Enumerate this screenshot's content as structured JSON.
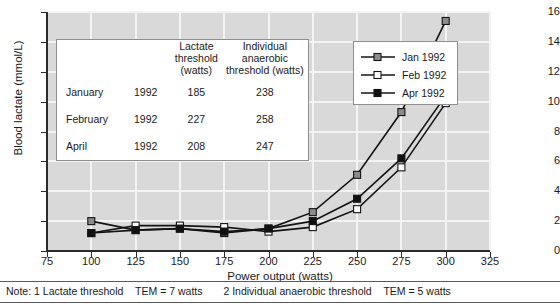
{
  "chart_data": {
    "type": "line",
    "title": "",
    "xlabel": "Power output (watts)",
    "ylabel": "Blood lactate (mmol/L)",
    "xlim": [
      75,
      325
    ],
    "ylim": [
      0,
      16
    ],
    "xticks": [
      75,
      100,
      125,
      150,
      175,
      200,
      225,
      250,
      275,
      300,
      325
    ],
    "yticks": [
      0,
      2,
      4,
      6,
      8,
      10,
      12,
      14,
      16
    ],
    "grid": true,
    "legend_position": "upper-right",
    "x": [
      100,
      125,
      150,
      175,
      200,
      225,
      250,
      275,
      300
    ],
    "series": [
      {
        "name": "Jan 1992",
        "marker": "filled-gray-square",
        "color": "#8c8c8c",
        "values": [
          2.0,
          1.4,
          1.5,
          1.2,
          1.5,
          2.6,
          5.1,
          9.3,
          15.4
        ]
      },
      {
        "name": "Feb 1992",
        "marker": "open-square",
        "color": "#ffffff",
        "values": [
          1.2,
          1.7,
          1.7,
          1.6,
          1.3,
          1.6,
          2.8,
          5.6,
          9.9
        ]
      },
      {
        "name": "Apr 1992",
        "marker": "filled-black-square",
        "color": "#111111",
        "values": [
          1.2,
          1.4,
          1.5,
          1.3,
          1.5,
          2.0,
          3.5,
          6.2,
          10.4
        ]
      }
    ]
  },
  "axes": {
    "ylabel": "Blood lactate (mmol/L)",
    "xlabel": "Power output (watts)",
    "yticks": [
      "0",
      "2",
      "4",
      "6",
      "8",
      "10",
      "12",
      "14",
      "16"
    ],
    "xticks": [
      "75",
      "100",
      "125",
      "150",
      "175",
      "200",
      "225",
      "250",
      "275",
      "300",
      "325"
    ]
  },
  "legend": {
    "items": [
      {
        "label": "Jan 1992",
        "marker": "filled-gray-square"
      },
      {
        "label": "Feb 1992",
        "marker": "open-square"
      },
      {
        "label": "Apr 1992",
        "marker": "filled-black-square"
      }
    ]
  },
  "inset_table": {
    "headers": {
      "blank": "",
      "col_year": "",
      "lactate_threshold": "Lactate threshold (watts)",
      "lactate_threshold_l1": "Lactate",
      "lactate_threshold_l2": "threshold",
      "lactate_threshold_l3": "(watts)",
      "iat_l1": "Individual",
      "iat_l2": "anaerobic",
      "iat_l3": "threshold (watts)"
    },
    "rows": [
      {
        "month": "January",
        "year": "1992",
        "lactate_threshold": "185",
        "individual_anaerobic_threshold": "238"
      },
      {
        "month": "February",
        "year": "1992",
        "lactate_threshold": "227",
        "individual_anaerobic_threshold": "258"
      },
      {
        "month": "April",
        "year": "1992",
        "lactate_threshold": "208",
        "individual_anaerobic_threshold": "247"
      }
    ]
  },
  "note": {
    "prefix": "Note:",
    "item1_num": "1",
    "item1_text": "Lactate threshold",
    "item1_tem": "TEM = 7 watts",
    "item2_num": "2",
    "item2_text": "Individual anaerobic threshold",
    "item2_tem": "TEM = 5 watts"
  },
  "colors": {
    "plot_background": "#d9d9d9",
    "gridline": "#f4f4f4",
    "axis": "#2b2b2b",
    "line": "#141414",
    "jan_marker": "#8c8c8c",
    "feb_marker": "#ffffff",
    "apr_marker": "#111111"
  }
}
